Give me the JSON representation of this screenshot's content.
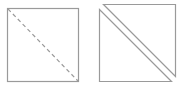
{
  "diagram": {
    "stroke_color": "#9a9a9a",
    "background": "#ffffff",
    "left_figure": {
      "shape": "square",
      "x": 7,
      "y": 8,
      "width": 71,
      "height": 73,
      "diagonal": {
        "style": "dashed",
        "from": "top-left",
        "to": "bottom-right"
      }
    },
    "right_figure": {
      "upper_triangle": {
        "points": [
          [
            103,
            4
          ],
          [
            175,
            4
          ],
          [
            175,
            76
          ]
        ]
      },
      "lower_triangle": {
        "points": [
          [
            99,
            9
          ],
          [
            99,
            81
          ],
          [
            171,
            81
          ]
        ]
      }
    }
  }
}
